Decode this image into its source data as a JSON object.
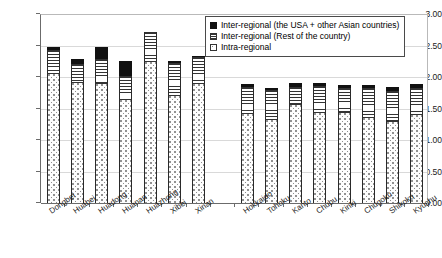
{
  "chart_data": {
    "type": "bar",
    "subtype": "stacked-column",
    "title": "",
    "xlabel": "",
    "ylabel": "",
    "ylim": [
      0.0,
      3.0
    ],
    "ytick_labels": [
      "3.00",
      "2.50",
      "2.00",
      "1.50",
      "1.00",
      "0.50",
      "0.00"
    ],
    "ytick_values": [
      3.0,
      2.5,
      2.0,
      1.5,
      1.0,
      0.5,
      0.0
    ],
    "ytick_interval": 0.5,
    "grid": true,
    "legend_position": "top-right",
    "categories": [
      "Dongbei",
      "Huabei",
      "Huadong",
      "Huanan",
      "Huazhong",
      "Xibei",
      "Xinan",
      "",
      "Hokkaido",
      "Tohoku",
      "Kanto",
      "Chubu",
      "Kinki",
      "Chugoku",
      "Shikoku",
      "Kyushu"
    ],
    "series": [
      {
        "name": "Intra-regional",
        "pattern": "dotted",
        "values": [
          2.06,
          1.92,
          1.9,
          1.65,
          2.25,
          1.72,
          1.91,
          null,
          1.43,
          1.33,
          1.57,
          1.44,
          1.45,
          1.37,
          1.3,
          1.41
        ]
      },
      {
        "name": "Inter-regional (Rest of the country)",
        "pattern": "horizontal-lines",
        "values": [
          0.37,
          0.28,
          0.38,
          0.36,
          0.46,
          0.5,
          0.4,
          null,
          0.41,
          0.46,
          0.27,
          0.41,
          0.38,
          0.45,
          0.48,
          0.42
        ]
      },
      {
        "name": "Inter-regional (the USA + other Asian countries)",
        "pattern": "solid-black",
        "values": [
          0.04,
          0.08,
          0.19,
          0.25,
          0.0,
          0.04,
          0.02,
          null,
          0.05,
          0.03,
          0.06,
          0.05,
          0.05,
          0.06,
          0.06,
          0.06
        ]
      }
    ],
    "totals": [
      2.47,
      2.28,
      2.47,
      2.26,
      2.71,
      2.26,
      2.33,
      null,
      1.89,
      1.82,
      1.9,
      1.9,
      1.88,
      1.88,
      1.84,
      1.89
    ],
    "colors": {
      "intra": "#fdfdfd",
      "inter_domestic": "#ffffff",
      "inter_international": "#111111",
      "outline": "#2a2a2a",
      "gridline": "#d9d9d9",
      "axis": "#6b6b6b"
    }
  },
  "legend": {
    "items": [
      {
        "label": "Inter-regional (the USA + other Asian countries)",
        "swatch": "solid-black-swatch"
      },
      {
        "label": "Inter-regional (Rest of the country)",
        "swatch": "horizontal-line-swatch"
      },
      {
        "label": "Intra-regional",
        "swatch": "dotted-swatch"
      }
    ]
  }
}
